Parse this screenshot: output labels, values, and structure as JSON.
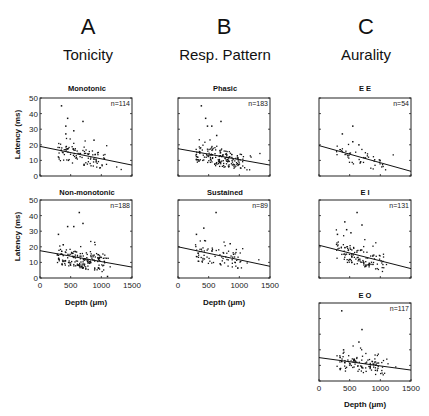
{
  "columns": [
    {
      "letter": "A",
      "title": "Tonicity"
    },
    {
      "letter": "B",
      "title": "Resp. Pattern"
    },
    {
      "letter": "C",
      "title": "Aurality"
    }
  ],
  "axis": {
    "ylabel": "Latency (ms)",
    "xlabel": "Depth (μm)",
    "yticks": [
      "0",
      "10",
      "20",
      "30",
      "40",
      "50"
    ],
    "xticks": [
      "0",
      "500",
      "1000",
      "1500"
    ]
  },
  "panels": {
    "a1": {
      "title": "Monotonic",
      "n": "n=114"
    },
    "a2": {
      "title": "Non-monotonic",
      "n": "n=188"
    },
    "b1": {
      "title": "Phasic",
      "n": "n=183"
    },
    "b2": {
      "title": "Sustained",
      "n": "n=89"
    },
    "c1": {
      "title": "E E",
      "n": "n=54"
    },
    "c2": {
      "title": "E I",
      "n": "n=131"
    },
    "c3": {
      "title": "E O",
      "n": "n=117"
    }
  },
  "chart_data": [
    {
      "type": "scatter",
      "title": "Monotonic",
      "group": "Tonicity",
      "n": 114,
      "xlabel": "Depth (μm)",
      "ylabel": "Latency (ms)",
      "xlim": [
        0,
        1500
      ],
      "ylim": [
        0,
        50
      ],
      "fit_line": {
        "x": [
          0,
          1500
        ],
        "y": [
          19,
          7
        ]
      },
      "outliers": [
        [
          350,
          45
        ],
        [
          450,
          37
        ],
        [
          420,
          32
        ],
        [
          700,
          35
        ],
        [
          420,
          27
        ],
        [
          550,
          29
        ],
        [
          880,
          23
        ]
      ]
    },
    {
      "type": "scatter",
      "title": "Non-monotonic",
      "group": "Tonicity",
      "n": 188,
      "xlabel": "Depth (μm)",
      "ylabel": "Latency (ms)",
      "xlim": [
        0,
        1500
      ],
      "ylim": [
        0,
        50
      ],
      "fit_line": {
        "x": [
          0,
          1500
        ],
        "y": [
          17.5,
          7
        ]
      },
      "outliers": [
        [
          640,
          42
        ],
        [
          700,
          35
        ],
        [
          450,
          33
        ],
        [
          550,
          33
        ],
        [
          300,
          28
        ],
        [
          1100,
          1
        ]
      ]
    },
    {
      "type": "scatter",
      "title": "Phasic",
      "group": "Resp. Pattern",
      "n": 183,
      "xlabel": "Depth (μm)",
      "ylabel": "Latency (ms)",
      "xlim": [
        0,
        1500
      ],
      "ylim": [
        0,
        50
      ],
      "fit_line": {
        "x": [
          0,
          1500
        ],
        "y": [
          17.5,
          7
        ]
      },
      "outliers": [
        [
          380,
          45
        ],
        [
          450,
          37
        ],
        [
          480,
          32
        ],
        [
          550,
          32
        ],
        [
          700,
          35
        ],
        [
          630,
          26
        ]
      ]
    },
    {
      "type": "scatter",
      "title": "Sustained",
      "group": "Resp. Pattern",
      "n": 89,
      "xlabel": "Depth (μm)",
      "ylabel": "Latency (ms)",
      "xlim": [
        0,
        1500
      ],
      "ylim": [
        0,
        50
      ],
      "fit_line": {
        "x": [
          0,
          1500
        ],
        "y": [
          20,
          7.5
        ]
      },
      "outliers": [
        [
          620,
          42
        ],
        [
          420,
          32
        ],
        [
          300,
          28
        ],
        [
          850,
          22
        ]
      ]
    },
    {
      "type": "scatter",
      "title": "E E",
      "group": "Aurality",
      "n": 54,
      "xlabel": "Depth (μm)",
      "ylabel": "Latency (ms)",
      "xlim": [
        0,
        1500
      ],
      "ylim": [
        0,
        50
      ],
      "fit_line": {
        "x": [
          0,
          1500
        ],
        "y": [
          19.5,
          3
        ]
      },
      "outliers": [
        [
          550,
          32
        ],
        [
          380,
          27
        ],
        [
          550,
          22
        ],
        [
          650,
          20
        ]
      ]
    },
    {
      "type": "scatter",
      "title": "E I",
      "group": "Aurality",
      "n": 131,
      "xlabel": "Depth (μm)",
      "ylabel": "Latency (ms)",
      "xlim": [
        0,
        1500
      ],
      "ylim": [
        0,
        50
      ],
      "fit_line": {
        "x": [
          0,
          1500
        ],
        "y": [
          21,
          6
        ]
      },
      "outliers": [
        [
          620,
          42
        ],
        [
          420,
          36
        ],
        [
          700,
          34
        ],
        [
          450,
          31
        ],
        [
          520,
          29
        ],
        [
          300,
          28
        ]
      ]
    },
    {
      "type": "scatter",
      "title": "E O",
      "group": "Aurality",
      "n": 117,
      "xlabel": "Depth (μm)",
      "ylabel": "Latency (ms)",
      "xlim": [
        0,
        1500
      ],
      "ylim": [
        0,
        50
      ],
      "fit_line": {
        "x": [
          0,
          1500
        ],
        "y": [
          15,
          7
        ]
      },
      "outliers": [
        [
          370,
          45
        ],
        [
          700,
          33
        ],
        [
          650,
          25
        ],
        [
          400,
          20
        ]
      ]
    }
  ]
}
